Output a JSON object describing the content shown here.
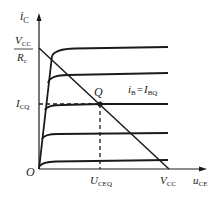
{
  "diagram": {
    "y_axis": {
      "label": "i",
      "label_sub": "C"
    },
    "x_axis": {
      "label": "u",
      "label_sub": "CE"
    },
    "origin_label": "O",
    "load_line_top": {
      "num": "V",
      "num_sub": "CC",
      "den": "R",
      "den_sub": "c"
    },
    "icq_label": {
      "main": "I",
      "sub": "CQ"
    },
    "ucq_label": {
      "main": "U",
      "sub": "CEQ"
    },
    "vcc_label": {
      "main": "V",
      "sub": "CC"
    },
    "q_label": "Q",
    "curve_label": {
      "lhs": "i",
      "lhs_sub": "B",
      "eq": "=",
      "rhs": "I",
      "rhs_sub": "BQ"
    },
    "colors": {
      "line": "#1a1a1a",
      "text": "#222222",
      "background": "#ffffff"
    },
    "curves_count": 5
  }
}
